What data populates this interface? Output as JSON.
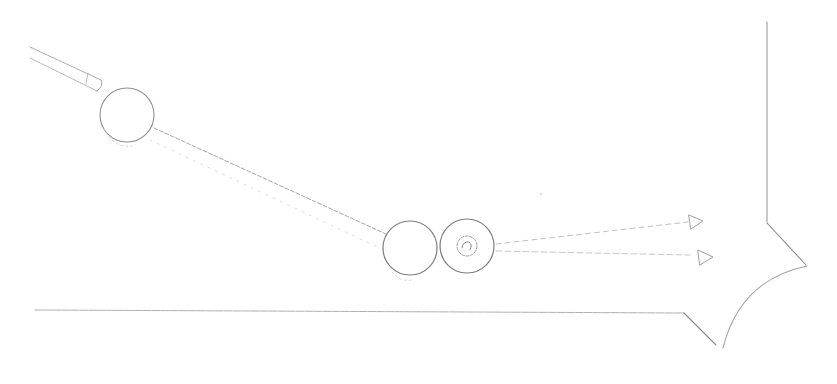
{
  "diagram": {
    "type": "billiard-collision-sketch",
    "colors": {
      "background": "#ffffff",
      "line": "#9a9a9a",
      "line_light": "#c4c4c4",
      "line_faint": "#d8d8d8"
    },
    "elements": {
      "cue_stick": {
        "label": "cue stick"
      },
      "cue_ball": {
        "label": "cue ball"
      },
      "object_ball_1": {
        "label": "ball"
      },
      "object_ball_2": {
        "label": "ball with spin marker"
      },
      "trajectory_arrows": [
        {
          "label": "direction arrow upper"
        },
        {
          "label": "direction arrow lower"
        }
      ],
      "table_rail": {
        "label": "table edge and pocket"
      }
    }
  }
}
